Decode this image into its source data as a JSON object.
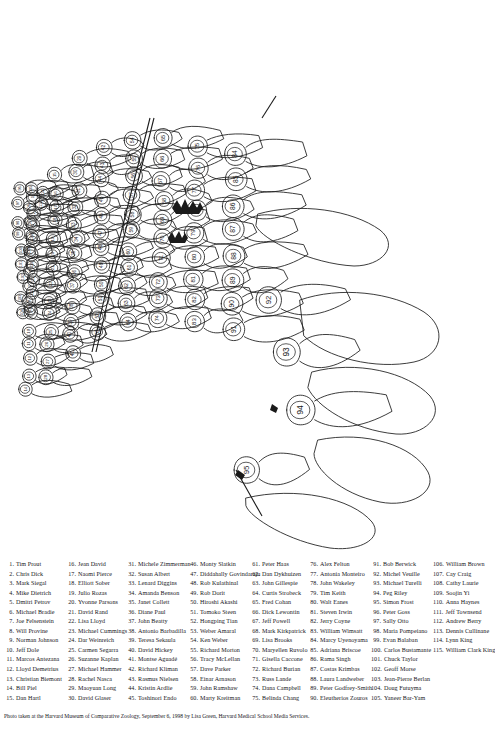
{
  "figure": {
    "caption_role": "numbered-outline-key-of-group-photograph",
    "total_people": 115,
    "ink_color": "#1a1a1a",
    "background_color": "#ffffff",
    "label_numbers": [
      1,
      2,
      3,
      4,
      5,
      6,
      7,
      8,
      9,
      10,
      11,
      12,
      13,
      14,
      15,
      16,
      17,
      18,
      19,
      20,
      21,
      22,
      23,
      24,
      25,
      26,
      27,
      28,
      29,
      30,
      31,
      32,
      33,
      34,
      35,
      36,
      37,
      38,
      39,
      40,
      41,
      42,
      43,
      44,
      45,
      46,
      47,
      48,
      49,
      50,
      51,
      52,
      53,
      54,
      55,
      56,
      57,
      58,
      59,
      60,
      61,
      62,
      63,
      64,
      65,
      66,
      67,
      68,
      69,
      70,
      71,
      72,
      73,
      74,
      75,
      76,
      77,
      78,
      79,
      80,
      81,
      82,
      83,
      84,
      85,
      86,
      87,
      88,
      89,
      90,
      91,
      92,
      93,
      94,
      95,
      96,
      97,
      98,
      99,
      100,
      101,
      102,
      103,
      104,
      105,
      106,
      107,
      108,
      109,
      110,
      111,
      112,
      113,
      114,
      115
    ]
  },
  "key": {
    "columns": [
      {
        "entries": [
          {
            "num": "1.",
            "name": "Tim Prout"
          },
          {
            "num": "2.",
            "name": "Chris Dick"
          },
          {
            "num": "3.",
            "name": "Mark Siegal"
          },
          {
            "num": "4.",
            "name": "Mike Dietrich"
          },
          {
            "num": "5.",
            "name": "Dmitri Petrov"
          },
          {
            "num": "6.",
            "name": "Michael Bradie"
          },
          {
            "num": "7.",
            "name": "Joe Felsenstein"
          },
          {
            "num": "8.",
            "name": "Will Provine"
          },
          {
            "num": "9.",
            "name": "Norman Johnson"
          },
          {
            "num": "10.",
            "name": "Jeff Dole"
          },
          {
            "num": "11.",
            "name": "Marcos Antezana"
          },
          {
            "num": "12.",
            "name": "Lloyd Demetrius"
          },
          {
            "num": "13.",
            "name": "Christian Biemont"
          },
          {
            "num": "14.",
            "name": "Bill Piel"
          },
          {
            "num": "15.",
            "name": "Dan Hartl"
          }
        ]
      },
      {
        "entries": [
          {
            "num": "16.",
            "name": "Jean David"
          },
          {
            "num": "17.",
            "name": "Naomi Pierce"
          },
          {
            "num": "18.",
            "name": "Elliott Sober"
          },
          {
            "num": "19.",
            "name": "Julio Rozas"
          },
          {
            "num": "20.",
            "name": "Yvonne Parsons"
          },
          {
            "num": "21.",
            "name": "David Rand"
          },
          {
            "num": "22.",
            "name": "Lisa Lloyd"
          },
          {
            "num": "23.",
            "name": "Michael Cummings"
          },
          {
            "num": "24.",
            "name": "Dar Weinreich"
          },
          {
            "num": "25.",
            "name": "Carmen Segarra"
          },
          {
            "num": "26.",
            "name": "Suzanne Kaplan"
          },
          {
            "num": "27.",
            "name": "Michael Hammer"
          },
          {
            "num": "28.",
            "name": "Rachel Nasca"
          },
          {
            "num": "29.",
            "name": "Maoyuan Long"
          },
          {
            "num": "30.",
            "name": "David Glaser"
          }
        ]
      },
      {
        "entries": [
          {
            "num": "31.",
            "name": "Michele Zimmerman"
          },
          {
            "num": "32.",
            "name": "Susan Albert"
          },
          {
            "num": "33.",
            "name": "Lenard Diggins"
          },
          {
            "num": "34.",
            "name": "Amanda Benson"
          },
          {
            "num": "35.",
            "name": "Janet Collett"
          },
          {
            "num": "36.",
            "name": "Diane Paul"
          },
          {
            "num": "37.",
            "name": "John Beatty"
          },
          {
            "num": "38.",
            "name": "Antonio Barbadilla"
          },
          {
            "num": "39.",
            "name": "Teresa Sekaula"
          },
          {
            "num": "40.",
            "name": "David Hickey"
          },
          {
            "num": "41.",
            "name": "Montse Aguadé"
          },
          {
            "num": "42.",
            "name": "Richard Kliman"
          },
          {
            "num": "43.",
            "name": "Rasmus Nielsen"
          },
          {
            "num": "44.",
            "name": "Kristin Ardlie"
          },
          {
            "num": "45.",
            "name": "Toshinori Endo"
          }
        ]
      },
      {
        "entries": [
          {
            "num": "46.",
            "name": "Monty Slatkin"
          },
          {
            "num": "47.",
            "name": "Diddahally Govindaraju"
          },
          {
            "num": "48.",
            "name": "Rob Kulathinal"
          },
          {
            "num": "49.",
            "name": "Rob Dorit"
          },
          {
            "num": "50.",
            "name": "Hiroshi Akashi"
          },
          {
            "num": "51.",
            "name": "Tomoko Steen"
          },
          {
            "num": "52.",
            "name": "Hongping Tian"
          },
          {
            "num": "53.",
            "name": "Weber Amaral"
          },
          {
            "num": "54.",
            "name": "Ken Weber"
          },
          {
            "num": "55.",
            "name": "Richard Morton"
          },
          {
            "num": "56.",
            "name": "Tracy McLellan"
          },
          {
            "num": "57.",
            "name": "Dave Parker"
          },
          {
            "num": "58.",
            "name": "Einar Arnason"
          },
          {
            "num": "59.",
            "name": "John Ramshaw"
          },
          {
            "num": "60.",
            "name": "Marty Kreitman"
          }
        ]
      },
      {
        "entries": [
          {
            "num": "61.",
            "name": "Peter Haas"
          },
          {
            "num": "62.",
            "name": "Dan Dykhuizen"
          },
          {
            "num": "63.",
            "name": "John Gillespie"
          },
          {
            "num": "64.",
            "name": "Curtis Strobeck"
          },
          {
            "num": "65.",
            "name": "Fred Cohan"
          },
          {
            "num": "66.",
            "name": "Dick Lewontin"
          },
          {
            "num": "67.",
            "name": "Jeff Powell"
          },
          {
            "num": "68.",
            "name": "Mark Kirkpatrick"
          },
          {
            "num": "69.",
            "name": "Lisa Brooks"
          },
          {
            "num": "70.",
            "name": "Maryellen Ruvolo"
          },
          {
            "num": "71.",
            "name": "Gisella Caccone"
          },
          {
            "num": "72.",
            "name": "Richard Burian"
          },
          {
            "num": "73.",
            "name": "Russ Lande"
          },
          {
            "num": "74.",
            "name": "Dana Campbell"
          },
          {
            "num": "75.",
            "name": "Belinda Chang"
          }
        ]
      },
      {
        "entries": [
          {
            "num": "76.",
            "name": "Alex Felton"
          },
          {
            "num": "77.",
            "name": "Antonia Monteiro"
          },
          {
            "num": "78.",
            "name": "John Wakeley"
          },
          {
            "num": "79.",
            "name": "Tim Keith"
          },
          {
            "num": "80.",
            "name": "Walt Eanes"
          },
          {
            "num": "81.",
            "name": "Steven Irwin"
          },
          {
            "num": "82.",
            "name": "Jerry Coyne"
          },
          {
            "num": "83.",
            "name": "William Wimsatt"
          },
          {
            "num": "84.",
            "name": "Marcy Uyenoyama"
          },
          {
            "num": "85.",
            "name": "Adriana Briscoe"
          },
          {
            "num": "86.",
            "name": "Rama Singh"
          },
          {
            "num": "87.",
            "name": "Costas Krimbas"
          },
          {
            "num": "88.",
            "name": "Laura Landweber"
          },
          {
            "num": "89.",
            "name": "Peter Godfrey-Smith"
          },
          {
            "num": "90.",
            "name": "Eleutherios Zouros"
          }
        ]
      },
      {
        "entries": [
          {
            "num": "91.",
            "name": "Bob Berwick"
          },
          {
            "num": "92.",
            "name": "Michel Veuille"
          },
          {
            "num": "93.",
            "name": "Michael Turelli"
          },
          {
            "num": "94.",
            "name": "Peg Riley"
          },
          {
            "num": "95.",
            "name": "Simon Frost"
          },
          {
            "num": "96.",
            "name": "Peter Goss"
          },
          {
            "num": "97.",
            "name": "Sally Otto"
          },
          {
            "num": "98.",
            "name": "Maria Pompeiano"
          },
          {
            "num": "99.",
            "name": "Evan Balaban"
          },
          {
            "num": "100.",
            "name": "Carlos Bustamante"
          },
          {
            "num": "101.",
            "name": "Chuck Taylor"
          },
          {
            "num": "102.",
            "name": "Geoff Morse"
          },
          {
            "num": "103.",
            "name": "Jean-Pierre Berlan"
          },
          {
            "num": "104.",
            "name": "Doug Futuyma"
          },
          {
            "num": "105.",
            "name": "Yaneer Bar-Yam"
          }
        ]
      },
      {
        "entries": [
          {
            "num": "106.",
            "name": "William Brown"
          },
          {
            "num": "107.",
            "name": "Cay Craig"
          },
          {
            "num": "108.",
            "name": "Cathy Laurie"
          },
          {
            "num": "109.",
            "name": "Soojin Yi"
          },
          {
            "num": "110.",
            "name": "Anna Haynes"
          },
          {
            "num": "111.",
            "name": "Jeff Townsend"
          },
          {
            "num": "112.",
            "name": "Andrew Berry"
          },
          {
            "num": "113.",
            "name": "Dennis Cullinane"
          },
          {
            "num": "114.",
            "name": "Lynn King"
          },
          {
            "num": "115.",
            "name": "William Clark King"
          }
        ]
      }
    ]
  },
  "credit": {
    "text": "Photo taken at the Harvard Museum of Comparative Zoology, September 6, 1998 by Lisa Green, Harvard Medical School Media Services."
  }
}
